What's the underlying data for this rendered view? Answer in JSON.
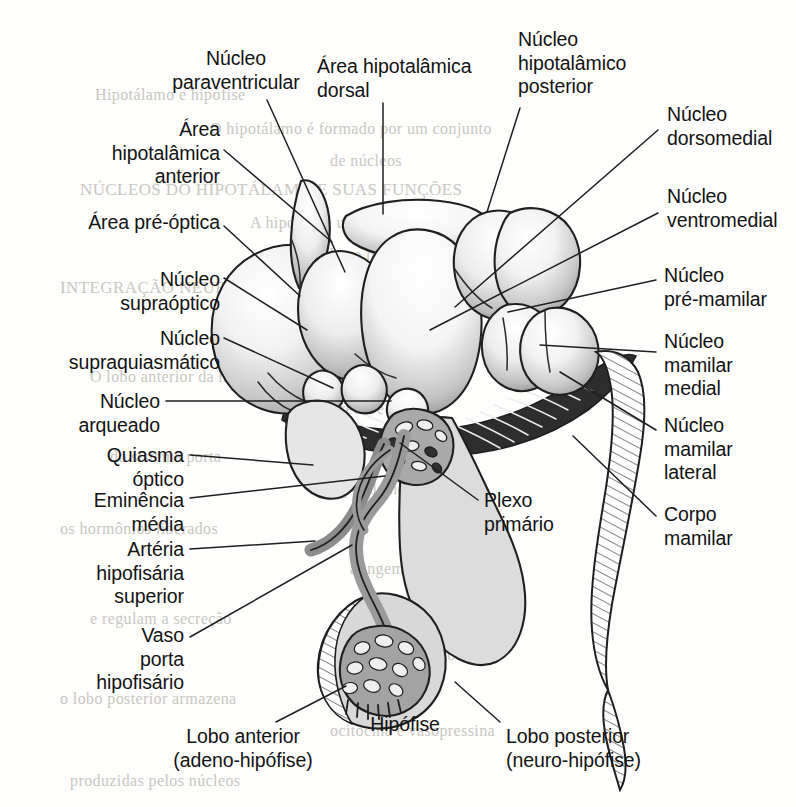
{
  "figure": {
    "width": 796,
    "height": 807,
    "ink": "#1a1a1a",
    "paper": "#fefefd",
    "ghost_ink": "#c9c7c2"
  },
  "labels": [
    {
      "id": "nucleo-paraventricular",
      "text": "Núcleo\nparaventricular",
      "align": "c",
      "x": 151,
      "y": 47,
      "w": 170
    },
    {
      "id": "area-hipotalamica-dorsal",
      "text": "Área hipotalâmica\ndorsal",
      "align": "l",
      "x": 317,
      "y": 55,
      "w": 200
    },
    {
      "id": "nucleo-hipotalamico-posterior",
      "text": "Núcleo\nhipotalâmico\nposterior",
      "align": "l",
      "x": 518,
      "y": 28,
      "w": 165
    },
    {
      "id": "nucleo-dorsomedial",
      "text": "Núcleo\ndorsomedial",
      "align": "l",
      "x": 667,
      "y": 103,
      "w": 130
    },
    {
      "id": "area-hipotalamica-anterior",
      "text": "Área\nhipotalâmica\nanterior",
      "align": "r",
      "x": 60,
      "y": 118,
      "w": 160
    },
    {
      "id": "nucleo-ventromedial",
      "text": "Núcleo\nventromedial",
      "align": "l",
      "x": 667,
      "y": 185,
      "w": 130
    },
    {
      "id": "area-pre-optica",
      "text": "Área pré-óptica",
      "align": "r",
      "x": 36,
      "y": 211,
      "w": 184
    },
    {
      "id": "nucleo-supraoptico",
      "text": "Núcleo\nsupraóptico",
      "align": "r",
      "x": 22,
      "y": 268,
      "w": 198
    },
    {
      "id": "nucleo-pre-mamilar",
      "text": "Núcleo\npré-mamilar",
      "align": "l",
      "x": 664,
      "y": 264,
      "w": 132
    },
    {
      "id": "nucleo-supraquiasmatico",
      "text": "Núcleo\nsupraquiasmático",
      "align": "r",
      "x": 14,
      "y": 327,
      "w": 206
    },
    {
      "id": "nucleo-mamilar-medial",
      "text": "Núcleo\nmamilar\nmedial",
      "align": "l",
      "x": 664,
      "y": 330,
      "w": 132
    },
    {
      "id": "nucleo-arqueado",
      "text": "Núcleo\narqueado",
      "align": "r",
      "x": 30,
      "y": 390,
      "w": 130
    },
    {
      "id": "nucleo-mamilar-lateral",
      "text": "Núcleo\nmamilar\nlateral",
      "align": "l",
      "x": 664,
      "y": 414,
      "w": 132
    },
    {
      "id": "quiasma-optico",
      "text": "Quiasma\nóptico",
      "align": "r",
      "x": 40,
      "y": 444,
      "w": 144
    },
    {
      "id": "eminencia-media",
      "text": "Eminência\nmédia",
      "align": "r",
      "x": 30,
      "y": 489,
      "w": 154
    },
    {
      "id": "plexo-primario",
      "text": "Plexo\nprimário",
      "align": "l",
      "x": 484,
      "y": 489,
      "w": 130
    },
    {
      "id": "corpo-mamilar",
      "text": "Corpo\nmamilar",
      "align": "l",
      "x": 664,
      "y": 503,
      "w": 132
    },
    {
      "id": "arteria-hipofisaria-superior",
      "text": "Artéria\nhipofisária\nsuperior",
      "align": "r",
      "x": 40,
      "y": 538,
      "w": 144
    },
    {
      "id": "vaso-porta-hipofisario",
      "text": "Vaso\nporta\nhipofisário",
      "align": "r",
      "x": 30,
      "y": 624,
      "w": 154
    },
    {
      "id": "lobo-anterior",
      "text": "Lobo anterior\n(adeno-hipófise)",
      "align": "c",
      "x": 138,
      "y": 725,
      "w": 210
    },
    {
      "id": "hipofise",
      "text": "Hipófise",
      "align": "c",
      "x": 350,
      "y": 713,
      "w": 110
    },
    {
      "id": "lobo-posterior",
      "text": "Lobo posterior\n(neuro-hipófise)",
      "align": "l",
      "x": 506,
      "y": 725,
      "w": 210
    }
  ],
  "leaders": [
    {
      "id": "leader-nucleo-paraventricular",
      "d": "M 267,100 L 345,272"
    },
    {
      "id": "leader-area-hipotalamica-dorsal",
      "d": "M 383,103 L 383,214"
    },
    {
      "id": "leader-nucleo-hipotalamico-posterior",
      "d": "M 520,108 L 487,212"
    },
    {
      "id": "leader-nucleo-dorsomedial",
      "d": "M 658,130 L 455,307"
    },
    {
      "id": "leader-area-hipotalamica-anterior",
      "d": "M 224,150 L 332,242"
    },
    {
      "id": "leader-nucleo-ventromedial",
      "d": "M 658,213 L 430,330"
    },
    {
      "id": "leader-area-pre-optica",
      "d": "M 224,226 L 300,296"
    },
    {
      "id": "leader-nucleo-supraoptico",
      "d": "M 224,278 L 307,330"
    },
    {
      "id": "leader-nucleo-pre-mamilar",
      "d": "M 656,280 L 508,312"
    },
    {
      "id": "leader-nucleo-supraquiasmatico",
      "d": "M 224,338 L 333,388"
    },
    {
      "id": "leader-nucleo-mamilar-medial",
      "d": "M 656,352 L 540,345"
    },
    {
      "id": "leader-nucleo-arqueado",
      "d": "M 166,401 L 391,401"
    },
    {
      "id": "leader-nucleo-mamilar-lateral",
      "d": "M 656,430 L 560,372"
    },
    {
      "id": "leader-quiasma-optico",
      "d": "M 190,455 L 313,465"
    },
    {
      "id": "leader-eminencia-media",
      "d": "M 190,498 L 385,476"
    },
    {
      "id": "leader-plexo-primario",
      "d": "M 478,500 L 400,443"
    },
    {
      "id": "leader-corpo-mamilar",
      "d": "M 656,516 L 573,436"
    },
    {
      "id": "leader-arteria-hipofisaria-superior",
      "d": "M 190,549 L 315,541"
    },
    {
      "id": "leader-vaso-porta-hipofisario",
      "d": "M 190,637 L 352,545"
    },
    {
      "id": "leader-lobo-anterior",
      "d": "M 276,722 L 346,686"
    },
    {
      "id": "leader-lobo-posterior",
      "d": "M 500,722 L 455,682"
    }
  ],
  "ghost_text": [
    {
      "text": "Hipotálamo e hipófise",
      "x": 95,
      "y": 86,
      "size": 16
    },
    {
      "text": "O hipotálamo é formado por um conjunto",
      "x": 210,
      "y": 120,
      "size": 16
    },
    {
      "text": "de núcleos",
      "x": 330,
      "y": 152,
      "size": 16
    },
    {
      "text": "NÚCLEOS DO HIPOTÁLAMO E SUAS FUNÇÕES",
      "x": 80,
      "y": 180,
      "size": 17
    },
    {
      "text": "A hipófise é uma glândula",
      "x": 250,
      "y": 214,
      "size": 16
    },
    {
      "text": "ligada ao hipotálamo",
      "x": 300,
      "y": 246,
      "size": 16
    },
    {
      "text": "INTEGRAÇÃO NEUROENDÓCRINA",
      "x": 60,
      "y": 278,
      "size": 17
    },
    {
      "text": "pelo infundíbulo",
      "x": 300,
      "y": 306,
      "size": 16
    },
    {
      "text": "O lobo anterior da hipófise",
      "x": 90,
      "y": 368,
      "size": 16
    },
    {
      "text": "recebe sangue",
      "x": 340,
      "y": 400,
      "size": 16
    },
    {
      "text": "do sistema porta",
      "x": 110,
      "y": 448,
      "size": 16
    },
    {
      "text": "hipotálamo-hipofisário",
      "x": 330,
      "y": 480,
      "size": 16
    },
    {
      "text": "os hormônios liberados",
      "x": 60,
      "y": 520,
      "size": 16
    },
    {
      "text": "atingem a adeno-hipófise",
      "x": 350,
      "y": 560,
      "size": 16
    },
    {
      "text": "e regulam a secreção",
      "x": 90,
      "y": 610,
      "size": 16
    },
    {
      "text": "de hormônios tróficos",
      "x": 340,
      "y": 646,
      "size": 16
    },
    {
      "text": "o lobo posterior armazena",
      "x": 60,
      "y": 690,
      "size": 16
    },
    {
      "text": "ocitocina e vasopressina",
      "x": 330,
      "y": 722,
      "size": 16
    },
    {
      "text": "produzidas pelos núcleos",
      "x": 70,
      "y": 772,
      "size": 16
    }
  ]
}
